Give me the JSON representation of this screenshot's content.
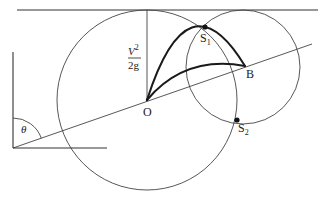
{
  "diagram": {
    "type": "projectile-on-inclined-plane",
    "labels": {
      "origin": "O",
      "point_b": "B",
      "s1_letter": "S",
      "s1_sub": "1",
      "s2_letter": "S",
      "s2_sub": "2",
      "angle": "θ",
      "height_num_base": "V",
      "height_num_exp": "2",
      "height_den": "2g"
    },
    "colors": {
      "line": "#444444",
      "thick": "#1a1a1a",
      "text": "#222222",
      "background": "#ffffff"
    },
    "geometry": {
      "origin": [
        147,
        100
      ],
      "point_b": [
        245,
        66
      ],
      "s1": [
        205,
        27
      ],
      "s2": [
        237,
        120
      ],
      "large_circle": {
        "cx": 147,
        "cy": 100,
        "r": 90
      },
      "small_circle": {
        "cx": 243,
        "cy": 67,
        "r": 57
      },
      "directrix_y": 10,
      "angle_vertex": [
        13,
        148
      ]
    }
  }
}
